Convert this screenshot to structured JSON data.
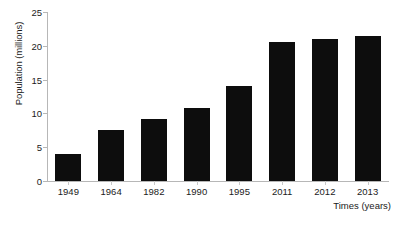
{
  "chart_data": {
    "type": "bar",
    "title": "",
    "subtitle": "",
    "xlabel": "Times (years)",
    "ylabel": "Population (millions)",
    "categories": [
      "1949",
      "1964",
      "1982",
      "1990",
      "1995",
      "2011",
      "2012",
      "2013"
    ],
    "values": [
      4.0,
      7.5,
      9.2,
      10.8,
      14.0,
      20.5,
      21.0,
      21.5
    ],
    "series": [
      {
        "name": "Population",
        "values": [
          4.0,
          7.5,
          9.2,
          10.8,
          14.0,
          20.5,
          21.0,
          21.5
        ]
      }
    ],
    "ylim": [
      0,
      25
    ],
    "yticks": [
      "0",
      "5",
      "10",
      "15",
      "20",
      "25"
    ],
    "ytick_values": [
      0,
      5,
      10,
      15,
      20,
      25
    ],
    "grid": false,
    "legend": "none",
    "bar_color": "#0d0d0d",
    "axis_color": "#b7b7b7",
    "background_color": "#ffffff",
    "annotations": []
  }
}
